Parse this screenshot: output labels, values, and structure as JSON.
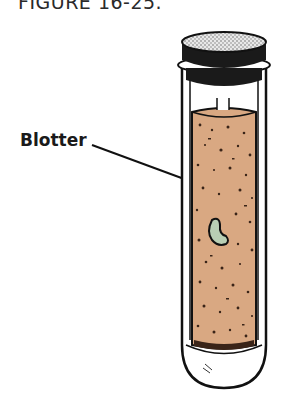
{
  "figure": {
    "title": "FIGURE 16-25.",
    "labels": [
      {
        "text": "Blotter",
        "points_to": "blotter"
      }
    ],
    "elements": [
      {
        "name": "test-tube",
        "description": "Glass test tube with rounded bottom"
      },
      {
        "name": "stopper",
        "description": "Cork stopper on top of tube"
      },
      {
        "name": "blotter",
        "description": "Rolled blotter paper lining the tube"
      },
      {
        "name": "seed",
        "description": "Bean seed between blotter and glass"
      }
    ],
    "colors": {
      "blotter": "#d9a882",
      "blotter_speckle": "#3a2418",
      "seed": "#b9cfb4",
      "outline": "#111111",
      "stopper_top": "#d8d8d8",
      "stopper_body": "#1a1a1a"
    }
  }
}
